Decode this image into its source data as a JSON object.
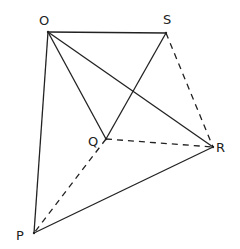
{
  "diagram": {
    "type": "geometric-figure",
    "points": [
      {
        "id": "O",
        "label": "O",
        "x": 48,
        "y": 32,
        "lx": 39,
        "ly": 25
      },
      {
        "id": "S",
        "label": "S",
        "x": 166,
        "y": 33,
        "lx": 163,
        "ly": 24
      },
      {
        "id": "Q",
        "label": "Q",
        "x": 106,
        "y": 139,
        "lx": 88,
        "ly": 146
      },
      {
        "id": "R",
        "label": "R",
        "x": 213,
        "y": 147,
        "lx": 216,
        "ly": 152
      },
      {
        "id": "P",
        "label": "P",
        "x": 34,
        "y": 233,
        "lx": 16,
        "ly": 240
      }
    ],
    "edges": [
      {
        "from": "O",
        "to": "S",
        "style": "solid"
      },
      {
        "from": "O",
        "to": "Q",
        "style": "solid"
      },
      {
        "from": "O",
        "to": "R",
        "style": "solid"
      },
      {
        "from": "O",
        "to": "P",
        "style": "solid"
      },
      {
        "from": "S",
        "to": "Q",
        "style": "solid"
      },
      {
        "from": "P",
        "to": "R",
        "style": "solid"
      },
      {
        "from": "S",
        "to": "R",
        "style": "dashed"
      },
      {
        "from": "Q",
        "to": "R",
        "style": "dashed"
      },
      {
        "from": "Q",
        "to": "P",
        "style": "dashed"
      }
    ],
    "line_color": "#222222",
    "background": "#ffffff"
  }
}
